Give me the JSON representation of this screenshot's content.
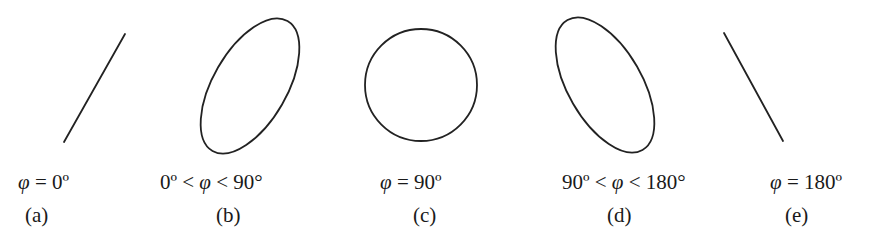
{
  "figure": {
    "stroke_color": "#222222",
    "panels": [
      {
        "id": "a",
        "shape": "line",
        "condition_parts": [
          "",
          "φ",
          " = 0º"
        ],
        "caption": "(a)",
        "geometry": {
          "x1": 64,
          "y1": 142,
          "x2": 125,
          "y2": 34
        }
      },
      {
        "id": "b",
        "shape": "ellipse",
        "condition_parts": [
          "0º < ",
          "φ",
          " < 90°"
        ],
        "caption": "(b)",
        "geometry": {
          "cx": 250,
          "cy": 86,
          "rx": 37,
          "ry": 75,
          "rotate": 30
        }
      },
      {
        "id": "c",
        "shape": "circle",
        "condition_parts": [
          "",
          "φ",
          " = 90º"
        ],
        "caption": "(c)",
        "geometry": {
          "cx": 421,
          "cy": 85,
          "r": 56
        }
      },
      {
        "id": "d",
        "shape": "ellipse",
        "condition_parts": [
          "90º < ",
          "φ",
          " < 180°"
        ],
        "caption": "(d)",
        "geometry": {
          "cx": 605,
          "cy": 85,
          "rx": 37,
          "ry": 75,
          "rotate": -30
        }
      },
      {
        "id": "e",
        "shape": "line",
        "condition_parts": [
          "",
          "φ",
          " = 180º"
        ],
        "caption": "(e)",
        "geometry": {
          "x1": 724,
          "y1": 33,
          "x2": 783,
          "y2": 141
        }
      }
    ]
  }
}
